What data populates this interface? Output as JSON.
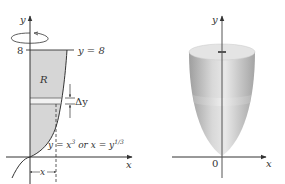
{
  "left_figure": {
    "y_axis_label": "y",
    "x_axis_label": "x",
    "tick_8_label": "8",
    "line_label": "y = 8",
    "region_label": "R",
    "strip_label": "Δy",
    "curve_label_part1": "y = x",
    "curve_label_exp1": "3",
    "curve_label_part2": " or x = y",
    "curve_label_exp2": "1/3",
    "bracket_label": "x",
    "rotation_icon": "rotation-arrow-ellipse"
  },
  "right_figure": {
    "y_axis_label": "y",
    "x_axis_label": "x",
    "origin_label": "0",
    "solid": "paraboloid-of-revolution"
  },
  "colors": {
    "region_fill": "#d6d6d6",
    "strip_fill": "#f0f0f0",
    "axis": "#333333",
    "solid_light": "#e6e6e6",
    "solid_dark": "#a8a8a8"
  }
}
